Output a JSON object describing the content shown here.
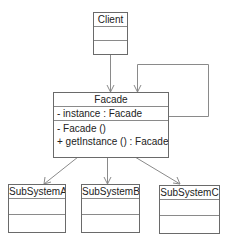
{
  "diagram": {
    "type": "UML class diagram (Facade pattern)",
    "colors": {
      "line": "#8a8a8a",
      "border": "#6a6a6a",
      "text": "#222222"
    },
    "classes": {
      "client": {
        "name": "Client",
        "attributes": [],
        "operations": []
      },
      "facade": {
        "name": "Facade",
        "attributes": [
          "- instance : Facade"
        ],
        "operations": [
          "-  Facade ()",
          "+ getInstance () : Facade"
        ]
      },
      "subsystem_a": {
        "name": "SubSystemA",
        "attributes": [],
        "operations": []
      },
      "subsystem_b": {
        "name": "SubSystemB",
        "attributes": [],
        "operations": []
      },
      "subsystem_c": {
        "name": "SubSystemC",
        "attributes": [],
        "operations": []
      }
    },
    "relationships": [
      {
        "from": "Client",
        "to": "Facade",
        "type": "association"
      },
      {
        "from": "Facade",
        "to": "Facade",
        "type": "self-association"
      },
      {
        "from": "Facade",
        "to": "SubSystemA",
        "type": "association"
      },
      {
        "from": "Facade",
        "to": "SubSystemB",
        "type": "association"
      },
      {
        "from": "Facade",
        "to": "SubSystemC",
        "type": "association"
      }
    ]
  }
}
